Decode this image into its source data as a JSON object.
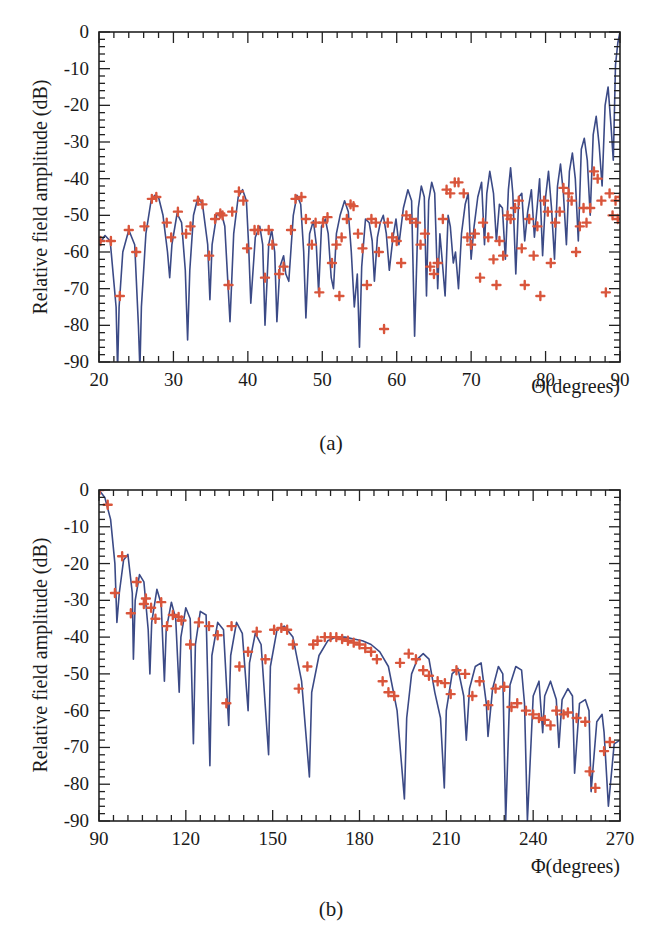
{
  "figure": {
    "panels": [
      "(a)",
      "(b)"
    ]
  },
  "chart_data": [
    {
      "type": "line",
      "panel_label": "(a)",
      "title": "",
      "xlabel": "Θ(degrees)",
      "ylabel": "Relative field amplitude (dB)",
      "xlim": [
        20,
        90
      ],
      "ylim": [
        -90,
        0
      ],
      "xticks": [
        20,
        30,
        40,
        50,
        60,
        70,
        80,
        90
      ],
      "yticks": [
        0,
        -10,
        -20,
        -30,
        -40,
        -50,
        -60,
        -70,
        -80,
        -90
      ],
      "grid": false,
      "legend": null,
      "colors": {
        "line": "#3b4a86",
        "markers": "#d9553b"
      },
      "series": [
        {
          "name": "computed pattern (line)",
          "style": "line",
          "x": [
            20,
            20.8,
            21.5,
            22.3,
            22.5,
            22.7,
            23.2,
            24,
            24.8,
            25.3,
            25.5,
            25.7,
            26.3,
            27,
            27.5,
            28,
            28.6,
            29.2,
            29.5,
            29.8,
            30.5,
            31.1,
            31.6,
            31.9,
            32.2,
            32.7,
            33.3,
            33.9,
            34.6,
            34.9,
            35.2,
            35.8,
            36.4,
            36.9,
            37.3,
            37.6,
            38.1,
            38.7,
            39.3,
            39.8,
            40.1,
            40.4,
            41,
            41.6,
            42,
            42.3,
            42.8,
            43.2,
            43.6,
            43.9,
            44.3,
            44.8,
            45.1,
            45.5,
            46.1,
            46.6,
            47.1,
            47.5,
            47.8,
            48.3,
            48.8,
            49.2,
            49.5,
            49.9,
            50.4,
            50.8,
            51.2,
            51.5,
            51.9,
            52.4,
            53,
            53.5,
            53.9,
            54.3,
            54.7,
            55,
            55.3,
            55.8,
            56.3,
            56.7,
            57,
            57.4,
            57.8,
            58.2,
            58.6,
            59,
            59.5,
            59.9,
            60.3,
            60.9,
            61.5,
            62,
            62.4,
            62.9,
            63.3,
            63.7,
            64,
            64.3,
            64.7,
            65.1,
            65.5,
            65.8,
            66.1,
            66.5,
            66.9,
            67.2,
            67.6,
            67.9,
            68.3,
            68.7,
            69.2,
            69.6,
            70,
            70.4,
            70.9,
            71.4,
            71.8,
            72.1,
            72.5,
            73,
            73.4,
            73.8,
            74.2,
            74.6,
            75,
            75.3,
            75.6,
            76,
            76.4,
            76.8,
            77.2,
            77.6,
            78.1,
            78.5,
            78.9,
            79.2,
            79.6,
            80,
            80.4,
            80.8,
            81.2,
            81.6,
            82,
            82.4,
            82.8,
            83.2,
            83.6,
            84,
            84.4,
            84.8,
            85.2,
            85.6,
            86,
            86.4,
            86.8,
            87.2,
            87.6,
            88,
            88.4,
            88.8,
            89.1,
            89.4,
            89.7,
            90
          ],
          "y": [
            -58,
            -55.5,
            -57,
            -75,
            -92,
            -75,
            -60,
            -54,
            -58,
            -80,
            -92,
            -75,
            -55,
            -46,
            -44.5,
            -45,
            -50,
            -60,
            -67,
            -58,
            -49.5,
            -52,
            -65,
            -84,
            -65,
            -50,
            -45,
            -47,
            -58,
            -73,
            -58,
            -50,
            -49,
            -53,
            -68,
            -79,
            -55,
            -45,
            -43,
            -46,
            -58,
            -74,
            -56,
            -53,
            -58,
            -80,
            -58,
            -54,
            -60,
            -79,
            -64,
            -61,
            -66,
            -68,
            -50,
            -44.5,
            -47,
            -60,
            -78,
            -55,
            -51.5,
            -58,
            -71,
            -53,
            -51,
            -55,
            -67,
            -70,
            -55,
            -50,
            -46,
            -49,
            -60,
            -75,
            -66,
            -86,
            -64,
            -51,
            -52,
            -57,
            -68,
            -56,
            -52,
            -50,
            -55,
            -65,
            -56,
            -51,
            -58,
            -48,
            -43,
            -46,
            -83,
            -48,
            -42,
            -45,
            -72,
            -46,
            -41,
            -44,
            -70,
            -55,
            -62,
            -72,
            -50,
            -53,
            -63,
            -60,
            -70,
            -55,
            -47,
            -44,
            -62,
            -53,
            -45,
            -41,
            -58,
            -44,
            -38,
            -44,
            -57,
            -47,
            -48,
            -62,
            -43,
            -37,
            -44,
            -66,
            -45,
            -44,
            -57,
            -49,
            -43,
            -56,
            -47,
            -40,
            -61,
            -45,
            -38,
            -48,
            -62,
            -42,
            -36,
            -44,
            -58,
            -38,
            -33,
            -40,
            -57,
            -32,
            -29,
            -35,
            -50,
            -28,
            -23,
            -31,
            -42,
            -20,
            -15,
            -26,
            -35,
            -9,
            -3,
            0
          ]
        },
        {
          "name": "measured / computed samples (+ markers)",
          "style": "markers",
          "x": [
            20.2,
            21.6,
            22.8,
            24,
            25,
            26.1,
            27.1,
            27.7,
            29.1,
            29.7,
            30.6,
            31.7,
            32.3,
            33.3,
            33.9,
            34.8,
            35.6,
            36.3,
            36.6,
            37.4,
            37.9,
            38.8,
            39.4,
            39.9,
            40.9,
            41.4,
            42.3,
            42.8,
            43.3,
            44.2,
            44.8,
            45.8,
            46.4,
            47.2,
            47.8,
            48.6,
            49.1,
            49.6,
            50.1,
            50.7,
            51.3,
            51.9,
            52.3,
            52.6,
            53.3,
            53.8,
            54.2,
            54.8,
            55.4,
            56,
            56.6,
            57.2,
            57.6,
            58.3,
            58.8,
            59.4,
            60,
            60.6,
            61.3,
            61.8,
            62.6,
            63.2,
            63.8,
            64.5,
            65,
            65.5,
            66.2,
            66.7,
            67.2,
            67.8,
            68.3,
            69,
            69.5,
            70,
            70.5,
            71.2,
            71.6,
            72.3,
            73,
            73.4,
            73.8,
            74.3,
            74.9,
            75.3,
            75.9,
            76.4,
            76.8,
            77.2,
            77.8,
            78.4,
            78.9,
            79.3,
            79.8,
            80.3,
            80.7,
            81.3,
            81.9,
            82.4,
            83.1,
            83.5,
            84.1,
            84.6,
            85.1,
            85.5,
            86,
            86.5,
            87,
            87.5,
            88.1,
            88.6,
            89,
            89.4,
            89.7,
            90
          ],
          "y": [
            -57,
            -57,
            -72,
            -54,
            -60,
            -53,
            -45.5,
            -45,
            -52,
            -56,
            -49,
            -55,
            -53,
            -46,
            -47,
            -61,
            -51,
            -49.5,
            -50,
            -69,
            -49,
            -43.5,
            -46,
            -59,
            -54,
            -54,
            -67,
            -54,
            -58,
            -66,
            -64,
            -54,
            -45.5,
            -45,
            -51,
            -58,
            -52,
            -71,
            -52,
            -50.5,
            -63,
            -58,
            -72,
            -56,
            -51,
            -47,
            -47.5,
            -55,
            -59,
            -69,
            -51,
            -52,
            -60,
            -81,
            -52,
            -56,
            -57,
            -63,
            -50,
            -51,
            -52,
            -58,
            -55,
            -64,
            -66,
            -63,
            -51,
            -43,
            -44,
            -41,
            -41,
            -44,
            -56,
            -58,
            -55,
            -67,
            -52,
            -56,
            -62,
            -69,
            -57,
            -61,
            -50,
            -51,
            -48,
            -46,
            -59,
            -69,
            -51,
            -61,
            -53,
            -72,
            -46,
            -49,
            -63,
            -52,
            -49,
            -42.5,
            -44,
            -46,
            -60,
            -53,
            -48,
            -52,
            -48,
            -38,
            -40,
            -46,
            -71,
            -44,
            -50,
            -46,
            -51,
            -45,
            -37,
            -43,
            -56,
            -57,
            -42,
            -44,
            -52,
            -51,
            -43,
            -34,
            -35,
            -52,
            -40,
            -37,
            -38,
            -32,
            -42,
            -31,
            -33,
            -36,
            -29,
            -30,
            -36,
            -26,
            -23,
            -32,
            -19,
            -18,
            -26,
            -12,
            -8,
            -3,
            -1
          ],
          "note": "approximate sample positions read from the figure; some marker values beyond the first pass are listed for density"
        }
      ]
    },
    {
      "type": "line",
      "panel_label": "(b)",
      "title": "",
      "xlabel": "Φ(degrees)",
      "ylabel": "Relative field amplitude (dB)",
      "xlim": [
        90,
        270
      ],
      "ylim": [
        -90,
        0
      ],
      "xticks": [
        90,
        120,
        150,
        180,
        210,
        240,
        270
      ],
      "yticks": [
        0,
        -10,
        -20,
        -30,
        -40,
        -50,
        -60,
        -70,
        -80,
        -90
      ],
      "grid": false,
      "legend": null,
      "colors": {
        "line": "#3b4a86",
        "markers": "#d9553b"
      },
      "series": [
        {
          "name": "computed pattern (line)",
          "style": "line",
          "x": [
            90,
            92,
            94,
            95.5,
            96.2,
            97,
            98.5,
            100,
            101.5,
            101.9,
            102.5,
            104,
            105.5,
            107,
            107.6,
            108.2,
            110,
            111.5,
            112.6,
            113.2,
            115,
            116.5,
            117.7,
            118.3,
            120,
            121.5,
            122.6,
            123.3,
            125,
            127,
            128.3,
            129,
            131,
            133,
            134.8,
            135.5,
            137.5,
            139.5,
            141.5,
            142,
            144,
            146,
            148.6,
            149.2,
            151.5,
            154,
            157,
            160,
            162.7,
            163.5,
            166,
            169,
            172,
            175,
            178,
            181,
            184,
            187,
            190,
            193,
            195.5,
            196.3,
            198,
            200,
            202,
            204,
            206,
            208,
            209.3,
            210,
            212,
            214,
            216,
            216.9,
            218,
            220,
            222,
            223.8,
            224.4,
            226,
            228,
            229.5,
            230.5,
            232,
            234,
            236,
            237,
            238,
            240,
            242,
            243.3,
            244,
            246,
            248,
            248.9,
            250,
            252,
            253.6,
            254.3,
            256,
            258,
            259.3,
            260,
            262,
            263.8,
            264.5,
            266,
            268,
            270
          ],
          "y": [
            0,
            -2,
            -8,
            -20,
            -36,
            -28,
            -19,
            -17.5,
            -28,
            -46,
            -30,
            -23,
            -25,
            -38,
            -50,
            -36,
            -27,
            -31,
            -52,
            -38,
            -30.5,
            -35,
            -55,
            -40,
            -32,
            -35,
            -69,
            -42,
            -33,
            -34,
            -75,
            -45,
            -36,
            -38,
            -64,
            -45,
            -36,
            -39,
            -60,
            -47,
            -39,
            -42,
            -72,
            -48,
            -38,
            -37,
            -40,
            -52,
            -78,
            -55,
            -45,
            -41,
            -40,
            -40,
            -40.5,
            -41,
            -42,
            -44,
            -48,
            -60,
            -84,
            -62,
            -50,
            -46,
            -44.5,
            -46,
            -55,
            -62,
            -81,
            -60,
            -50,
            -48.5,
            -56,
            -68,
            -54,
            -48,
            -47,
            -58,
            -67,
            -54,
            -48,
            -50,
            -90,
            -53,
            -48,
            -49,
            -58,
            -90,
            -56,
            -52,
            -66,
            -56,
            -52,
            -57,
            -70,
            -57,
            -54,
            -56,
            -77,
            -58,
            -57,
            -60,
            -82,
            -63,
            -61,
            -66,
            -86,
            -69,
            -68,
            -70
          ]
        },
        {
          "name": "measured / computed samples (+ markers)",
          "style": "markers",
          "x": [
            90.2,
            93,
            95.5,
            98,
            101,
            103,
            105.5,
            106.2,
            108,
            109.5,
            111.5,
            113.5,
            115.5,
            117.5,
            118.5,
            121.5,
            124.5,
            128,
            131,
            134,
            135.8,
            138.5,
            141.5,
            144.5,
            147.5,
            150.5,
            153,
            155,
            157,
            159,
            162,
            164,
            165.5,
            168,
            170,
            172,
            174,
            176,
            178,
            180,
            182,
            184,
            186,
            188,
            190,
            192,
            194,
            197,
            199.5,
            202,
            204,
            207,
            209.5,
            211.5,
            213.5,
            216.5,
            219,
            221.5,
            224.5,
            227,
            230,
            232.5,
            234.5,
            237.5,
            240,
            242,
            244,
            246,
            248,
            250.5,
            252,
            255,
            258,
            259.5,
            261.5,
            264.5,
            266.5
          ],
          "y": [
            0,
            -4,
            -28,
            -18,
            -33.5,
            -25,
            -31,
            -29.5,
            -32,
            -35,
            -30.5,
            -37,
            -34,
            -34.5,
            -35.5,
            -42,
            -36,
            -37,
            -39.5,
            -58,
            -37,
            -48,
            -44,
            -38.5,
            -46,
            -38,
            -37.5,
            -38,
            -42,
            -54,
            -48,
            -42,
            -41,
            -40,
            -40,
            -40,
            -40.5,
            -41,
            -41.5,
            -42,
            -43,
            -44,
            -46,
            -52,
            -55,
            -56,
            -47,
            -44.5,
            -46,
            -49,
            -50.5,
            -52,
            -52.5,
            -55.5,
            -49,
            -50,
            -56,
            -52,
            -58.5,
            -54,
            -53.5,
            -59,
            -58,
            -60,
            -61,
            -62,
            -62.5,
            -64,
            -60,
            -61,
            -60.5,
            -62,
            -63,
            -76.5,
            -81,
            -71,
            -68.5
          ],
          "note": "approximate sample positions read from the figure"
        }
      ]
    }
  ],
  "labels": {
    "a": {
      "ylabel": "Relative field amplitude (dB)",
      "xlabel": "Θ(degrees)",
      "caption": "(a)",
      "xtick_labels": [
        "20",
        "30",
        "40",
        "50",
        "60",
        "70",
        "80",
        "90"
      ],
      "ytick_labels": [
        "0",
        "-10",
        "-20",
        "-30",
        "-40",
        "-50",
        "-60",
        "-70",
        "-80",
        "-90"
      ]
    },
    "b": {
      "ylabel": "Relative field amplitude (dB)",
      "xlabel": "Φ(degrees)",
      "caption": "(b)",
      "xtick_labels": [
        "90",
        "120",
        "150",
        "180",
        "210",
        "240",
        "270"
      ],
      "ytick_labels": [
        "0",
        "-10",
        "-20",
        "-30",
        "-40",
        "-50",
        "-60",
        "-70",
        "-80",
        "-90"
      ]
    }
  }
}
